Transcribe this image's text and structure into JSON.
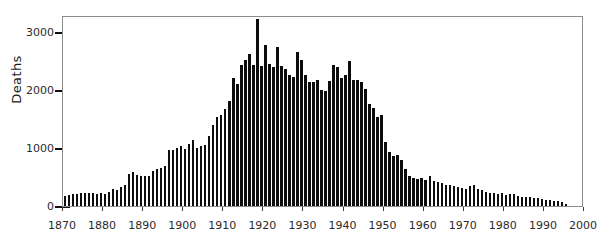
{
  "chart_data": {
    "type": "bar",
    "title": "",
    "xlabel": "",
    "ylabel": "Deaths",
    "xlim": [
      1870,
      2000
    ],
    "ylim": [
      0,
      3300
    ],
    "grid": false,
    "legend": null,
    "xticks": [
      1870,
      1880,
      1890,
      1900,
      1910,
      1920,
      1930,
      1940,
      1950,
      1960,
      1970,
      1980,
      1990,
      2000
    ],
    "yticks": [
      0,
      1000,
      2000,
      3000
    ],
    "bar_color": "#0d0d0d",
    "categories": [
      1870,
      1871,
      1872,
      1873,
      1874,
      1875,
      1876,
      1877,
      1878,
      1879,
      1880,
      1881,
      1882,
      1883,
      1884,
      1885,
      1886,
      1887,
      1888,
      1889,
      1890,
      1891,
      1892,
      1893,
      1894,
      1895,
      1896,
      1897,
      1898,
      1899,
      1900,
      1901,
      1902,
      1903,
      1904,
      1905,
      1906,
      1907,
      1908,
      1909,
      1910,
      1911,
      1912,
      1913,
      1914,
      1915,
      1916,
      1917,
      1918,
      1919,
      1920,
      1921,
      1922,
      1923,
      1924,
      1925,
      1926,
      1927,
      1928,
      1929,
      1930,
      1931,
      1932,
      1933,
      1934,
      1935,
      1936,
      1937,
      1938,
      1939,
      1940,
      1941,
      1942,
      1943,
      1944,
      1945,
      1946,
      1947,
      1948,
      1949,
      1950,
      1951,
      1952,
      1953,
      1954,
      1955,
      1956,
      1957,
      1958,
      1959,
      1960,
      1961,
      1962,
      1963,
      1964,
      1965,
      1966,
      1967,
      1968,
      1969,
      1970,
      1971,
      1972,
      1973,
      1974,
      1975,
      1976,
      1977,
      1978,
      1979,
      1980,
      1981,
      1982,
      1983,
      1984,
      1985,
      1986,
      1987,
      1988,
      1989,
      1990,
      1991,
      1992,
      1993,
      1994,
      1995
    ],
    "values": [
      175,
      185,
      210,
      215,
      230,
      225,
      220,
      225,
      215,
      220,
      215,
      250,
      300,
      285,
      330,
      360,
      560,
      580,
      530,
      520,
      520,
      525,
      610,
      640,
      660,
      700,
      960,
      965,
      1010,
      1040,
      980,
      1080,
      1145,
      1010,
      1035,
      1060,
      1210,
      1400,
      1530,
      1570,
      1680,
      1810,
      2220,
      2100,
      2440,
      2530,
      2620,
      2440,
      3230,
      2420,
      2780,
      2460,
      2400,
      2740,
      2420,
      2370,
      2260,
      2230,
      2660,
      2520,
      2270,
      2140,
      2150,
      2180,
      2000,
      1990,
      2160,
      2430,
      2400,
      2210,
      2260,
      2510,
      2180,
      2170,
      2150,
      2030,
      1760,
      1700,
      1530,
      1570,
      1100,
      940,
      860,
      890,
      800,
      640,
      520,
      480,
      470,
      480,
      450,
      520,
      430,
      420,
      400,
      370,
      370,
      350,
      330,
      310,
      300,
      340,
      360,
      300,
      270,
      250,
      230,
      220,
      210,
      220,
      190,
      200,
      200,
      170,
      150,
      160,
      150,
      140,
      130,
      120,
      110,
      100,
      95,
      85,
      75,
      35
    ]
  }
}
